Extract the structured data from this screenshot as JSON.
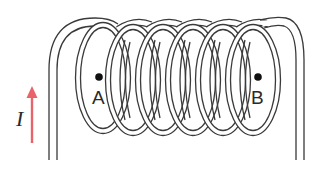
{
  "diagram": {
    "loop_count": 6,
    "points": [
      {
        "id": "A",
        "label": "A",
        "x": 99,
        "y": 77
      },
      {
        "id": "B",
        "label": "B",
        "x": 258,
        "y": 77
      }
    ],
    "current": {
      "label": "I",
      "direction": "up",
      "arrow_color": "#e8636a"
    },
    "colors": {
      "wire": "#3a3a3a",
      "background": "#ffffff",
      "text": "#2a2a2a"
    }
  }
}
